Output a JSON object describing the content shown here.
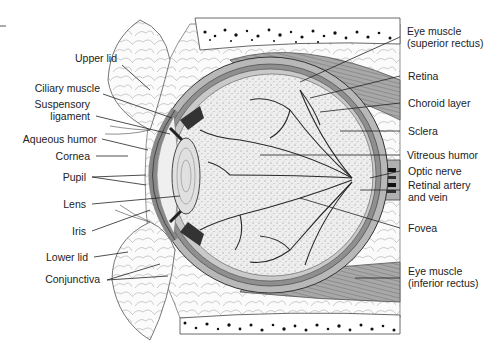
{
  "colors": {
    "ink": "#222222",
    "muscle": "#9a9a9a",
    "sclera": "#b5b5b5",
    "vitreous": "#e6e6e6",
    "fat": "#f4f4f4",
    "bone_dots": "#111111"
  },
  "labels_left": [
    {
      "id": "upper-lid",
      "text": "Upper lid",
      "x": 117,
      "y": 58
    },
    {
      "id": "ciliary-muscle",
      "text": "Ciliary muscle",
      "x": 97,
      "y": 88
    },
    {
      "id": "suspensory-ligament",
      "text": "Suspensory",
      "text2": "ligament",
      "x": 88,
      "y": 104
    },
    {
      "id": "aqueous-humor",
      "text": "Aqueous humor",
      "x": 95,
      "y": 133
    },
    {
      "id": "cornea",
      "text": "Cornea",
      "x": 90,
      "y": 150
    },
    {
      "id": "pupil",
      "text": "Pupil",
      "x": 86,
      "y": 171
    },
    {
      "id": "lens",
      "text": "Lens",
      "x": 86,
      "y": 198
    },
    {
      "id": "iris",
      "text": "Iris",
      "x": 86,
      "y": 225
    },
    {
      "id": "lower-lid",
      "text": "Lower lid",
      "x": 88,
      "y": 251
    },
    {
      "id": "conjunctiva",
      "text": "Conjunctiva",
      "x": 100,
      "y": 277
    }
  ],
  "labels_right": [
    {
      "id": "eye-muscle-superior",
      "text": "Eye muscle",
      "text2": "(superior rectus)",
      "x": 406,
      "y": 25
    },
    {
      "id": "retina",
      "text": "Retina",
      "x": 408,
      "y": 70
    },
    {
      "id": "choroid-layer",
      "text": "Choroid layer",
      "x": 408,
      "y": 97
    },
    {
      "id": "sclera",
      "text": "Sclera",
      "x": 408,
      "y": 126
    },
    {
      "id": "vitreous-humor",
      "text": "Vitreous humor",
      "x": 406,
      "y": 150
    },
    {
      "id": "optic-nerve",
      "text": "Optic nerve",
      "x": 407,
      "y": 166
    },
    {
      "id": "retinal-artery-vein",
      "text": "Retinal artery",
      "text2": "and vein",
      "x": 407,
      "y": 180
    },
    {
      "id": "fovea",
      "text": "Fovea",
      "x": 407,
      "y": 223
    },
    {
      "id": "eye-muscle-inferior",
      "text": "Eye muscle",
      "text2": "(inferior rectus)",
      "x": 407,
      "y": 266
    }
  ]
}
